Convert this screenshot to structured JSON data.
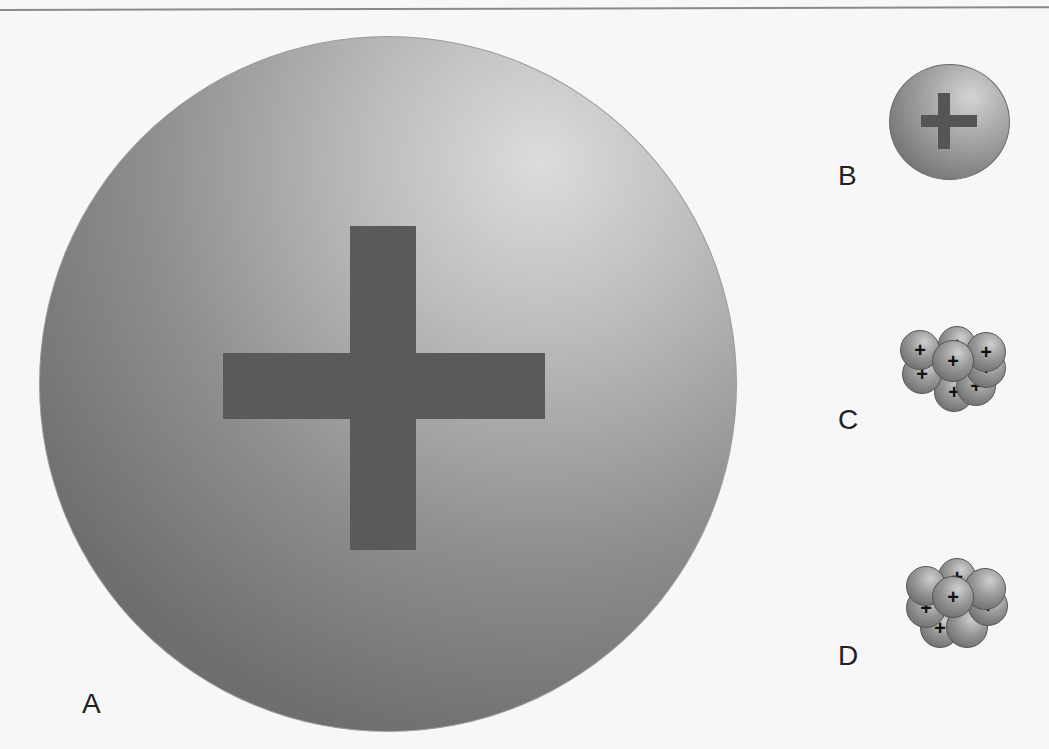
{
  "diagram": {
    "labels": {
      "a": "A",
      "b": "B",
      "c": "C",
      "d": "D"
    },
    "symbols": {
      "positive": "+"
    },
    "objects": [
      {
        "id": "A",
        "type": "large-sphere",
        "marked": "plus"
      },
      {
        "id": "B",
        "type": "small-sphere",
        "marked": "plus"
      },
      {
        "id": "C",
        "type": "cluster",
        "balls": 9,
        "all_plus": true
      },
      {
        "id": "D",
        "type": "cluster",
        "balls": 9,
        "plus_count": 5
      }
    ],
    "colors": {
      "background": "#f7f7f7",
      "sphere": "#8e8e8e",
      "cross": "#5a5a5a",
      "text": "#222222"
    }
  }
}
